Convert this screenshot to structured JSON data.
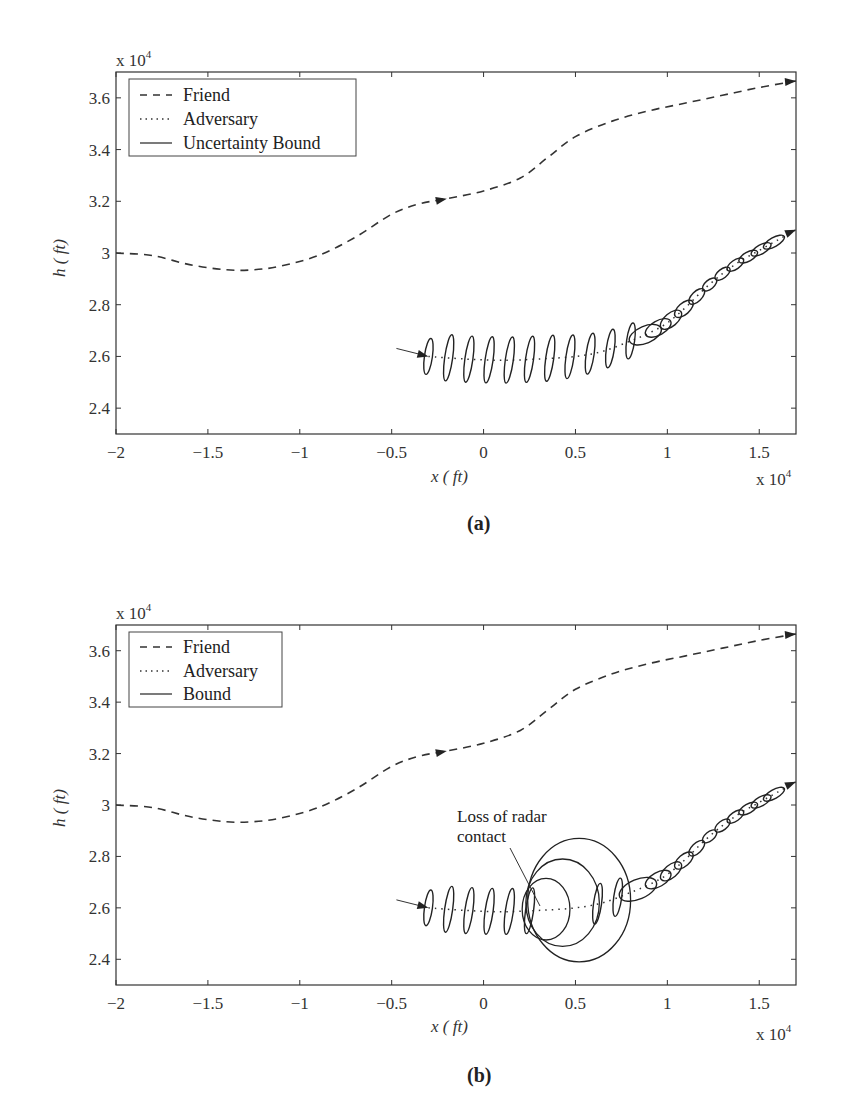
{
  "chart_data": [
    {
      "type": "line",
      "panel": "a",
      "caption": "(a)",
      "xlabel": "x ( ft)",
      "ylabel": "h ( ft)",
      "x_multiplier": "x 10",
      "x_multiplier_exp": "4",
      "y_multiplier": "x 10",
      "y_multiplier_exp": "4",
      "xlim": [
        -2,
        1.7
      ],
      "ylim": [
        2.3,
        3.7
      ],
      "xticks": [
        -2,
        -1.5,
        -1,
        -0.5,
        0,
        0.5,
        1,
        1.5
      ],
      "xtick_labels": [
        "−2",
        "−1.5",
        "−1",
        "−0.5",
        "0",
        "0.5",
        "1",
        "1.5"
      ],
      "yticks": [
        2.4,
        2.6,
        2.8,
        3.0,
        3.2,
        3.4,
        3.6
      ],
      "ytick_labels": [
        "2.4",
        "2.6",
        "2.8",
        "3",
        "3.2",
        "3.4",
        "3.6"
      ],
      "legend": {
        "position": "top-left",
        "entries": [
          "Friend",
          "Adversary",
          "Uncertainty Bound"
        ]
      },
      "series": [
        {
          "name": "Friend",
          "style": "dashed",
          "x": [
            -2.0,
            -1.8,
            -1.6,
            -1.4,
            -1.25,
            -1.1,
            -0.9,
            -0.7,
            -0.5,
            -0.35,
            -0.2,
            0.0,
            0.2,
            0.35,
            0.5,
            0.7,
            0.9,
            1.1,
            1.3,
            1.5,
            1.7
          ],
          "y": [
            3.0,
            2.99,
            2.955,
            2.935,
            2.935,
            2.95,
            2.99,
            3.06,
            3.15,
            3.19,
            3.21,
            3.24,
            3.29,
            3.37,
            3.45,
            3.51,
            3.55,
            3.58,
            3.61,
            3.64,
            3.665
          ],
          "arrows_at": [
            -0.2,
            1.7
          ]
        },
        {
          "name": "Adversary",
          "style": "dotted",
          "x": [
            -0.3,
            -0.1,
            0.1,
            0.3,
            0.5,
            0.65,
            0.8,
            0.9,
            1.0,
            1.1,
            1.2,
            1.3,
            1.4,
            1.5,
            1.6,
            1.7
          ],
          "y": [
            2.6,
            2.59,
            2.585,
            2.59,
            2.6,
            2.62,
            2.66,
            2.69,
            2.73,
            2.79,
            2.86,
            2.92,
            2.97,
            3.01,
            3.05,
            3.09
          ],
          "arrows_at": [
            -0.3,
            1.7
          ]
        },
        {
          "name": "Uncertainty Bound",
          "style": "solid",
          "type": "ellipses",
          "centers_x": [
            -0.3,
            -0.19,
            -0.08,
            0.03,
            0.14,
            0.25,
            0.36,
            0.47,
            0.58,
            0.69,
            0.8,
            0.88,
            0.95,
            1.02,
            1.09,
            1.16,
            1.23,
            1.3,
            1.37,
            1.44,
            1.51,
            1.58
          ],
          "semi_axis_h": [
            0.07,
            0.09,
            0.09,
            0.09,
            0.09,
            0.09,
            0.09,
            0.085,
            0.08,
            0.075,
            0.07,
            0.06,
            0.05,
            0.045,
            0.04,
            0.035,
            0.03,
            0.025,
            0.022,
            0.02,
            0.02,
            0.02
          ]
        }
      ]
    },
    {
      "type": "line",
      "panel": "b",
      "caption": "(b)",
      "xlabel": "x ( ft)",
      "ylabel": "h ( ft)",
      "x_multiplier": "x 10",
      "x_multiplier_exp": "4",
      "y_multiplier": "x 10",
      "y_multiplier_exp": "4",
      "xlim": [
        -2,
        1.7
      ],
      "ylim": [
        2.3,
        3.7
      ],
      "xticks": [
        -2,
        -1.5,
        -1,
        -0.5,
        0,
        0.5,
        1,
        1.5
      ],
      "xtick_labels": [
        "−2",
        "−1.5",
        "−1",
        "−0.5",
        "0",
        "0.5",
        "1",
        "1.5"
      ],
      "yticks": [
        2.4,
        2.6,
        2.8,
        3.0,
        3.2,
        3.4,
        3.6
      ],
      "ytick_labels": [
        "2.4",
        "2.6",
        "2.8",
        "3",
        "3.2",
        "3.4",
        "3.6"
      ],
      "legend": {
        "position": "top-left",
        "entries": [
          "Friend",
          "Adversary",
          "Bound"
        ]
      },
      "annotation": {
        "text_lines": [
          "Loss of radar",
          "contact"
        ],
        "points_to_x": 0.3,
        "points_to_y": 2.6
      },
      "series": [
        {
          "name": "Friend",
          "style": "dashed",
          "x": [
            -2.0,
            -1.8,
            -1.6,
            -1.4,
            -1.25,
            -1.1,
            -0.9,
            -0.7,
            -0.5,
            -0.35,
            -0.2,
            0.0,
            0.2,
            0.35,
            0.5,
            0.7,
            0.9,
            1.1,
            1.3,
            1.5,
            1.7
          ],
          "y": [
            3.0,
            2.99,
            2.955,
            2.935,
            2.935,
            2.95,
            2.99,
            3.06,
            3.15,
            3.19,
            3.21,
            3.24,
            3.29,
            3.37,
            3.45,
            3.51,
            3.55,
            3.58,
            3.61,
            3.64,
            3.665
          ],
          "arrows_at": [
            -0.2,
            1.7
          ]
        },
        {
          "name": "Adversary",
          "style": "dotted",
          "x": [
            -0.3,
            -0.1,
            0.1,
            0.3,
            0.5,
            0.65,
            0.8,
            0.9,
            1.0,
            1.1,
            1.2,
            1.3,
            1.4,
            1.5,
            1.6,
            1.7
          ],
          "y": [
            2.6,
            2.59,
            2.585,
            2.59,
            2.6,
            2.62,
            2.66,
            2.69,
            2.73,
            2.79,
            2.86,
            2.92,
            2.97,
            3.01,
            3.05,
            3.09
          ],
          "arrows_at": [
            -0.3,
            1.7
          ]
        },
        {
          "name": "Bound",
          "style": "solid",
          "type": "ellipses",
          "centers_x": [
            -0.3,
            -0.19,
            -0.08,
            0.03,
            0.14,
            0.25,
            0.62,
            0.73,
            0.84,
            0.95,
            1.02,
            1.09,
            1.16,
            1.23,
            1.3,
            1.37,
            1.44,
            1.51,
            1.58
          ],
          "semi_axis_h": [
            0.07,
            0.09,
            0.09,
            0.09,
            0.09,
            0.09,
            0.08,
            0.075,
            0.07,
            0.05,
            0.045,
            0.04,
            0.035,
            0.03,
            0.025,
            0.022,
            0.02,
            0.02,
            0.02
          ],
          "growing_bounds": [
            {
              "cx": 0.34,
              "cy": 2.595,
              "rx": 0.13,
              "ry": 0.12
            },
            {
              "cx": 0.43,
              "cy": 2.62,
              "rx": 0.2,
              "ry": 0.17
            },
            {
              "cx": 0.52,
              "cy": 2.63,
              "rx": 0.28,
              "ry": 0.24
            }
          ]
        }
      ]
    }
  ]
}
